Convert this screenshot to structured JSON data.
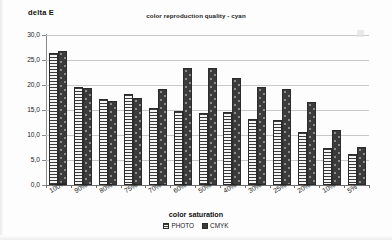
{
  "chart_data": {
    "type": "bar",
    "title": "color reproduction quality - cyan",
    "xlabel": "color saturation",
    "ylabel": "delta E",
    "ylim": [
      0.0,
      30.0
    ],
    "ytick_step": 5.0,
    "ytick_labels": [
      "30,0",
      "25,0",
      "20,0",
      "15,0",
      "10,0",
      "5,0",
      "0,0"
    ],
    "ytick_values": [
      30.0,
      25.0,
      20.0,
      15.0,
      10.0,
      5.0,
      0.0
    ],
    "grid": true,
    "legend_position": "bottom",
    "categories": [
      "100%",
      "90%",
      "80%",
      "75%",
      "70%",
      "60%",
      "50%",
      "40%",
      "30%",
      "25%",
      "20%",
      "10%",
      "5%"
    ],
    "series": [
      {
        "name": "PHOTO",
        "values": [
          26.4,
          19.6,
          17.2,
          18.2,
          15.5,
          14.8,
          14.4,
          14.6,
          13.3,
          13.0,
          10.6,
          7.5,
          6.3
        ]
      },
      {
        "name": "CMYK",
        "values": [
          26.9,
          19.4,
          16.9,
          17.5,
          19.3,
          23.5,
          23.5,
          21.4,
          19.6,
          19.3,
          16.7,
          11.0,
          7.6
        ]
      }
    ]
  },
  "colors": {
    "photo_fill": "#f2f2f2",
    "cmyk_fill": "#3b3b3b",
    "bar_border": "#2b2b2b",
    "gridline": "#c9c9c9",
    "axis": "#6e6e6e",
    "background": "#fdfdfd"
  }
}
